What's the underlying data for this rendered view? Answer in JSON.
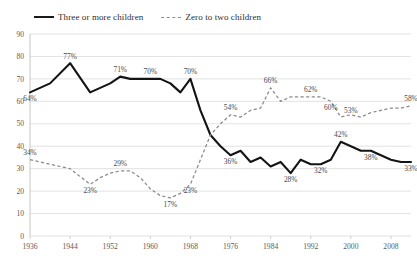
{
  "chart_data": {
    "type": "line",
    "title": "",
    "subtitle": "",
    "xlabel": "",
    "ylabel": "",
    "xlim": [
      1936,
      2012
    ],
    "ylim": [
      0,
      90
    ],
    "yticks": [
      0,
      10,
      20,
      30,
      40,
      50,
      60,
      70,
      80,
      90
    ],
    "xticks": [
      1936,
      1944,
      1952,
      1960,
      1968,
      1976,
      1984,
      1992,
      2000,
      2008
    ],
    "grid": true,
    "legend_position": "top-left",
    "series": [
      {
        "name": "Three or more children",
        "style": "solid",
        "color": "#141414",
        "x": [
          1936,
          1940,
          1944,
          1948,
          1950,
          1952,
          1954,
          1956,
          1958,
          1960,
          1962,
          1964,
          1966,
          1968,
          1970,
          1972,
          1974,
          1976,
          1978,
          1980,
          1982,
          1984,
          1986,
          1988,
          1990,
          1992,
          1994,
          1996,
          1998,
          2000,
          2002,
          2004,
          2006,
          2008,
          2010,
          2012
        ],
        "values": [
          64,
          68,
          77,
          64,
          66,
          68,
          71,
          70,
          70,
          70,
          70,
          68,
          64,
          70,
          56,
          45,
          40,
          36,
          38,
          33,
          35,
          31,
          33,
          28,
          34,
          32,
          32,
          34,
          42,
          40,
          38,
          38,
          36,
          34,
          33,
          33
        ],
        "labels": [
          {
            "x": 1936,
            "value": 64,
            "text": "64%",
            "pos": "below"
          },
          {
            "x": 1944,
            "value": 77,
            "text": "77%",
            "pos": "above"
          },
          {
            "x": 1954,
            "value": 71,
            "text": "71%",
            "pos": "above"
          },
          {
            "x": 1960,
            "value": 70,
            "text": "70%",
            "pos": "above"
          },
          {
            "x": 1968,
            "value": 70,
            "text": "70%",
            "pos": "above"
          },
          {
            "x": 1976,
            "value": 36,
            "text": "36%",
            "pos": "below"
          },
          {
            "x": 1988,
            "value": 28,
            "text": "28%",
            "pos": "below"
          },
          {
            "x": 1994,
            "value": 32,
            "text": "32%",
            "pos": "below"
          },
          {
            "x": 1998,
            "value": 42,
            "text": "42%",
            "pos": "above"
          },
          {
            "x": 2004,
            "value": 38,
            "text": "38%",
            "pos": "below"
          },
          {
            "x": 2012,
            "value": 33,
            "text": "33%",
            "pos": "below"
          }
        ]
      },
      {
        "name": "Zero to two children",
        "style": "dashed",
        "color": "#8a8a8a",
        "x": [
          1936,
          1940,
          1944,
          1948,
          1950,
          1952,
          1954,
          1956,
          1958,
          1960,
          1962,
          1964,
          1966,
          1968,
          1970,
          1972,
          1974,
          1976,
          1978,
          1980,
          1982,
          1984,
          1986,
          1988,
          1990,
          1992,
          1994,
          1996,
          1998,
          2000,
          2002,
          2004,
          2006,
          2008,
          2010,
          2012
        ],
        "values": [
          34,
          32,
          30,
          23,
          26,
          28,
          29,
          29,
          26,
          21,
          18,
          17,
          19,
          23,
          34,
          45,
          50,
          54,
          53,
          56,
          57,
          66,
          60,
          62,
          62,
          62,
          62,
          60,
          53,
          54,
          53,
          55,
          56,
          57,
          57,
          58
        ],
        "labels": [
          {
            "x": 1936,
            "value": 34,
            "text": "34%",
            "pos": "above"
          },
          {
            "x": 1948,
            "value": 23,
            "text": "23%",
            "pos": "below"
          },
          {
            "x": 1954,
            "value": 29,
            "text": "29%",
            "pos": "above"
          },
          {
            "x": 1964,
            "value": 17,
            "text": "17%",
            "pos": "below"
          },
          {
            "x": 1968,
            "value": 23,
            "text": "23%",
            "pos": "below"
          },
          {
            "x": 1976,
            "value": 54,
            "text": "54%",
            "pos": "above"
          },
          {
            "x": 1984,
            "value": 66,
            "text": "66%",
            "pos": "above"
          },
          {
            "x": 1992,
            "value": 62,
            "text": "62%",
            "pos": "above"
          },
          {
            "x": 1996,
            "value": 60,
            "text": "60%",
            "pos": "below"
          },
          {
            "x": 2000,
            "value": 53,
            "text": "53%",
            "pos": "above"
          },
          {
            "x": 2012,
            "value": 58,
            "text": "58%",
            "pos": "above"
          }
        ]
      }
    ]
  },
  "legend": {
    "entries": [
      {
        "label": "Three or more children",
        "style": "solid"
      },
      {
        "label": "Zero to two children",
        "style": "dashed"
      }
    ]
  },
  "colors": {
    "solid_series": "#141414",
    "dashed_series": "#8a8a8a",
    "gridline": "#d5d5d5",
    "axis": "#b9b9b9",
    "text": "#4a4a4a",
    "background": "#ffffff"
  }
}
